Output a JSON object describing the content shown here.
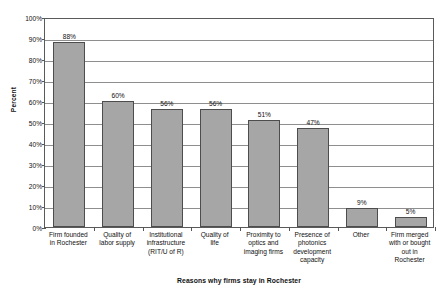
{
  "chart_data": {
    "type": "bar",
    "title": "",
    "xlabel": "Reasons why firms stay in Rochester",
    "ylabel": "Percent",
    "ylim": [
      0,
      100
    ],
    "grid": true,
    "legend": "none",
    "categories": [
      "Firm founded in Rochester",
      "Quality of labor supply",
      "Institutional infrastructure (RIT/U of R)",
      "Quality of life",
      "Proximity to optics and imaging firms",
      "Presence of photonics development capacity",
      "Other",
      "Firm merged with or bought out in Rochester"
    ],
    "category_lines": [
      [
        "Firm founded",
        "in Rochester"
      ],
      [
        "Quality of",
        "labor supply"
      ],
      [
        "Institutional",
        "infrastructure",
        "(RIT/U of R)"
      ],
      [
        "Quality of",
        "life"
      ],
      [
        "Proximity to",
        "optics and",
        "imaging firms"
      ],
      [
        "Presence of",
        "photonics",
        "development",
        "capacity"
      ],
      [
        "Other"
      ],
      [
        "Firm merged",
        "with or bought",
        "out in",
        "Rochester"
      ]
    ],
    "values": [
      88,
      60,
      56,
      56,
      51,
      47,
      9,
      5
    ],
    "value_labels": [
      "88%",
      "60%",
      "56%",
      "56%",
      "51%",
      "47%",
      "9%",
      "5%"
    ],
    "y_ticks": [
      0,
      10,
      20,
      30,
      40,
      50,
      60,
      70,
      80,
      90,
      100
    ],
    "y_tick_labels": [
      "0%",
      "10%",
      "20%",
      "30%",
      "40%",
      "50%",
      "60%",
      "70%",
      "80%",
      "90%",
      "100%"
    ],
    "colors": {
      "bar_fill": "#a6a6a6",
      "bar_border": "#4d4d4d",
      "gridline": "#8e8e8e",
      "axis": "#5a5a5a",
      "text": "#111111",
      "background": "#ffffff"
    }
  }
}
